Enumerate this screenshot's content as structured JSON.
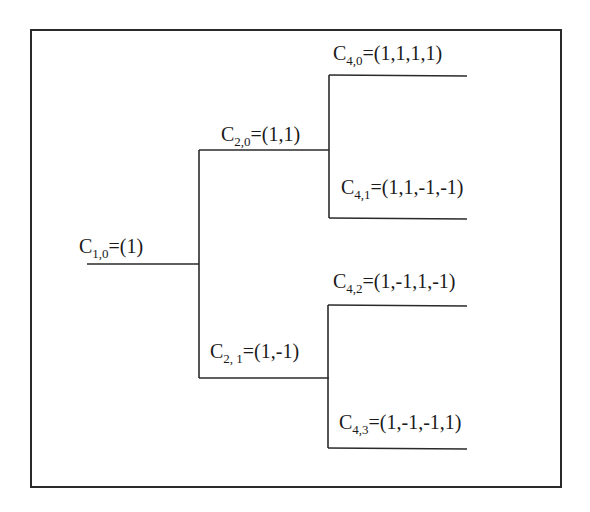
{
  "diagram": {
    "type": "code-tree",
    "nodes": [
      {
        "id": "c10",
        "name": "C",
        "sub": "1,0",
        "value": "=(1)",
        "level": 1
      },
      {
        "id": "c20",
        "name": "C",
        "sub": "2,0",
        "value": "=(1,1)",
        "level": 2,
        "parent": "c10"
      },
      {
        "id": "c21",
        "name": "C",
        "sub": "2, 1",
        "value": "=(1,-1)",
        "level": 2,
        "parent": "c10"
      },
      {
        "id": "c40",
        "name": "C",
        "sub": "4,0",
        "value": "=(1,1,1,1)",
        "level": 3,
        "parent": "c20"
      },
      {
        "id": "c41",
        "name": "C",
        "sub": "4,1",
        "value": "=(1,1,-1,-1)",
        "level": 3,
        "parent": "c20"
      },
      {
        "id": "c42",
        "name": "C",
        "sub": "4,2",
        "value": "=(1,-1,1,-1)",
        "level": 3,
        "parent": "c21"
      },
      {
        "id": "c43",
        "name": "C",
        "sub": "4,3",
        "value": "=(1,-1,-1,1)",
        "level": 3,
        "parent": "c21"
      }
    ],
    "colors": {
      "line": "#2a2a2a",
      "text": "#1a1a1a",
      "background": "#ffffff"
    }
  }
}
